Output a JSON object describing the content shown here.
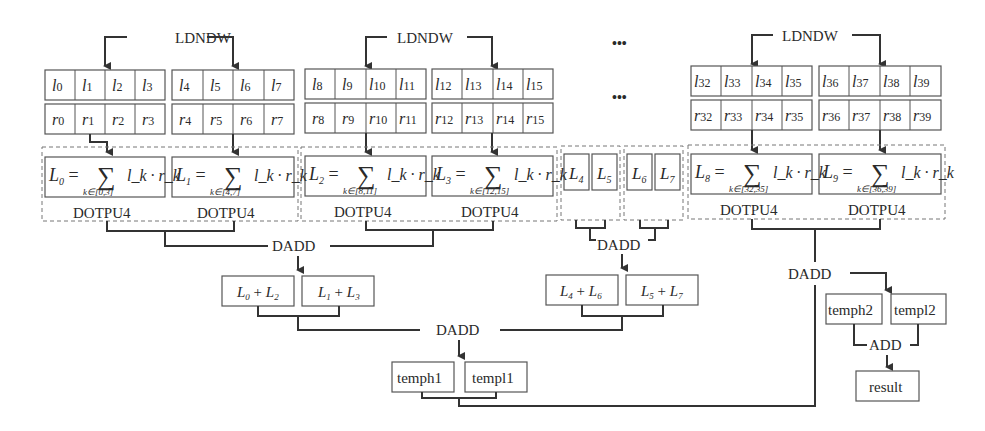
{
  "diagram": {
    "load_op": "LDNDW",
    "dot_op": "DOTPU4",
    "dadd_op": "DADD",
    "add_op": "ADD",
    "ellipsis": "•••",
    "groups": [
      {
        "l_cells": [
          "l0",
          "l1",
          "l2",
          "l3",
          "l4",
          "l5",
          "l6",
          "l7"
        ],
        "r_cells": [
          "r0",
          "r1",
          "r2",
          "r3",
          "r4",
          "r5",
          "r6",
          "r7"
        ],
        "sums": [
          {
            "lhs": "L0",
            "range": "k∈[0,3]"
          },
          {
            "lhs": "L1",
            "range": "k∈[4,7]"
          }
        ]
      },
      {
        "l_cells": [
          "l8",
          "l9",
          "l10",
          "l11",
          "l12",
          "l13",
          "l14",
          "l15"
        ],
        "r_cells": [
          "r8",
          "r9",
          "r10",
          "r11",
          "r12",
          "r13",
          "r14",
          "r15"
        ],
        "sums": [
          {
            "lhs": "L2",
            "range": "k∈[8,11]"
          },
          {
            "lhs": "L3",
            "range": "k∈[12,15]"
          }
        ]
      },
      {
        "l_cells": [
          "l32",
          "l33",
          "l34",
          "l35",
          "l36",
          "l37",
          "l38",
          "l39"
        ],
        "r_cells": [
          "r32",
          "r33",
          "r34",
          "r35",
          "r36",
          "r37",
          "r38",
          "r39"
        ],
        "sums": [
          {
            "lhs": "L8",
            "range": "k∈[32,35]"
          },
          {
            "lhs": "L9",
            "range": "k∈[36,39]"
          }
        ]
      }
    ],
    "sum_body": "l_k · r_k",
    "middle_regs": [
      "L4",
      "L5",
      "L6",
      "L7"
    ],
    "partial_sums": [
      "L0 + L2",
      "L1 + L3",
      "L4 + L6",
      "L5 + L7"
    ],
    "temps1": [
      "temph1",
      "templ1"
    ],
    "temps2": [
      "temph2",
      "templ2"
    ],
    "result": "result"
  }
}
